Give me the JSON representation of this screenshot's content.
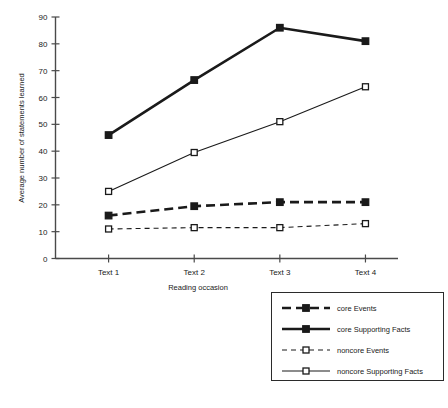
{
  "chart_data": {
    "type": "line",
    "title": "",
    "xlabel": "Reading occasion",
    "ylabel": "Average number of statements learned",
    "categories": [
      "Text 1",
      "Text 2",
      "Text 3",
      "Text 4"
    ],
    "ylim": [
      0,
      90
    ],
    "yticks": [
      0,
      10,
      20,
      30,
      40,
      50,
      60,
      70,
      80,
      90
    ],
    "grid": false,
    "legend_position": "bottom-right",
    "series": [
      {
        "name": "core Events",
        "values": [
          16,
          19.5,
          21,
          21
        ],
        "marker": "filled-square",
        "line": "dashed",
        "width": "thick"
      },
      {
        "name": "core Supporting Facts",
        "values": [
          46,
          66.5,
          86,
          81
        ],
        "marker": "filled-square",
        "line": "solid",
        "width": "thick"
      },
      {
        "name": "noncore Events",
        "values": [
          11,
          11.5,
          11.5,
          13
        ],
        "marker": "open-square",
        "line": "dashed",
        "width": "thin"
      },
      {
        "name": "noncore Supporting Facts",
        "values": [
          25,
          39.5,
          51,
          64
        ],
        "marker": "open-square",
        "line": "solid",
        "width": "thin"
      }
    ]
  },
  "legend": {
    "items": [
      {
        "label": "core Events"
      },
      {
        "label": "core Supporting Facts"
      },
      {
        "label": "noncore Events"
      },
      {
        "label": "noncore Supporting Facts"
      }
    ]
  },
  "caption": {
    "text": ""
  },
  "colors": {
    "line": "#1a1a1a",
    "axis": "#4a4a4a",
    "background": "#ffffff"
  }
}
